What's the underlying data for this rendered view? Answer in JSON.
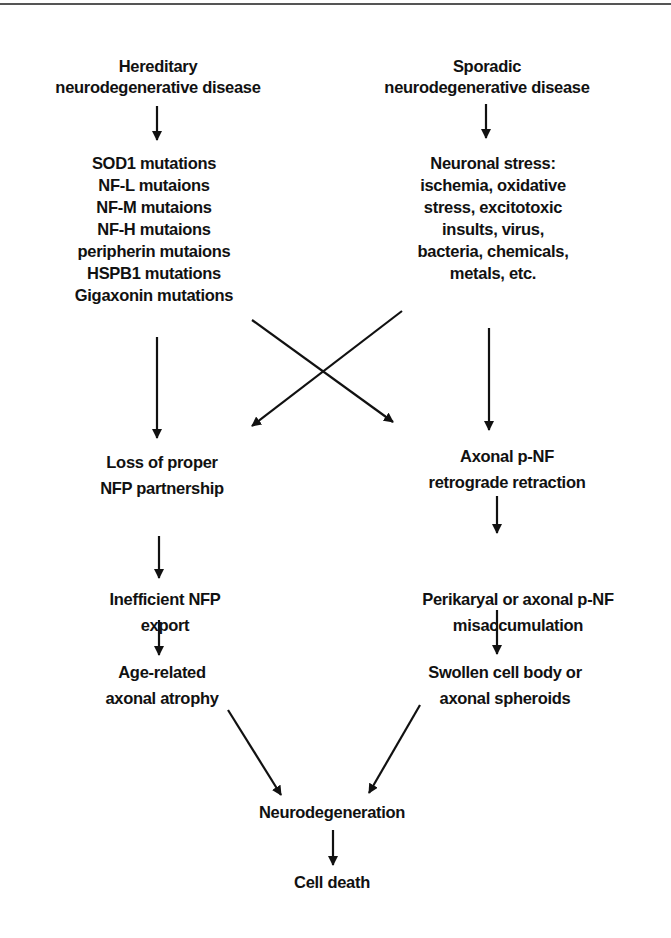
{
  "diagram": {
    "type": "flowchart",
    "nodes": {
      "hereditary": {
        "lines": [
          "Hereditary",
          "neurodegenerative disease"
        ]
      },
      "sporadic": {
        "lines": [
          "Sporadic",
          "neurodegenerative disease"
        ]
      },
      "mutations": {
        "lines": [
          "SOD1 mutations",
          "NF-L mutaions",
          "NF-M mutaions",
          "NF-H mutaions",
          "peripherin mutaions",
          "HSPB1 mutations",
          "Gigaxonin mutations"
        ]
      },
      "stress": {
        "lines": [
          "Neuronal stress:",
          "ischemia, oxidative",
          "stress, excitotoxic",
          "insults, virus,",
          "bacteria, chemicals,",
          "metals, etc."
        ]
      },
      "loss_partnership": {
        "lines": [
          "Loss of proper",
          "NFP partnership"
        ]
      },
      "retraction": {
        "lines": [
          "Axonal p-NF",
          "retrograde retraction"
        ]
      },
      "inefficient_export": {
        "lines": [
          "Inefficient NFP",
          "export"
        ]
      },
      "misaccumulation": {
        "lines": [
          "Perikaryal or axonal p-NF",
          "misaccumulation"
        ]
      },
      "atrophy": {
        "lines": [
          "Age-related",
          "axonal atrophy"
        ]
      },
      "swollen": {
        "lines": [
          "Swollen cell body or",
          "axonal spheroids"
        ]
      },
      "neurodegeneration": {
        "lines": [
          "Neurodegeneration"
        ]
      },
      "cell_death": {
        "lines": [
          "Cell death"
        ]
      }
    },
    "edges": [
      [
        "hereditary",
        "mutations"
      ],
      [
        "sporadic",
        "stress"
      ],
      [
        "mutations",
        "loss_partnership"
      ],
      [
        "mutations",
        "retraction"
      ],
      [
        "stress",
        "loss_partnership"
      ],
      [
        "stress",
        "retraction"
      ],
      [
        "loss_partnership",
        "inefficient_export"
      ],
      [
        "inefficient_export",
        "atrophy"
      ],
      [
        "retraction",
        "misaccumulation"
      ],
      [
        "misaccumulation",
        "swollen"
      ],
      [
        "atrophy",
        "neurodegeneration"
      ],
      [
        "swollen",
        "neurodegeneration"
      ],
      [
        "neurodegeneration",
        "cell_death"
      ]
    ]
  }
}
